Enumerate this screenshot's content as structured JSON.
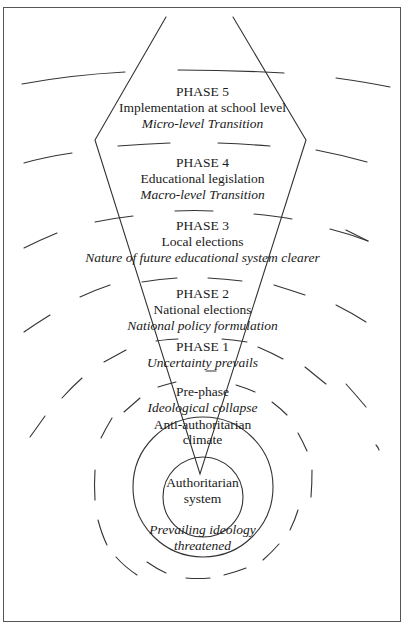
{
  "diagram": {
    "phases": [
      {
        "title": "PHASE 5",
        "line1": "Implementation at school level",
        "line2": "Micro-level Transition"
      },
      {
        "title": "PHASE 4",
        "line1": "Educational legislation",
        "line2": "Macro-level Transition"
      },
      {
        "title": "PHASE 3",
        "line1": "Local elections",
        "line2": "Nature of future educational system clearer"
      },
      {
        "title": "PHASE 2",
        "line1": "National elections",
        "line2": "National policy formulation"
      },
      {
        "title": "PHASE 1",
        "line2": "Uncertainty prevails"
      }
    ],
    "prephase": {
      "title": "Pre-phase",
      "subtitle": "Ideological collapse"
    },
    "climate": {
      "line1": "Anti-authoritarian",
      "line2": "climate"
    },
    "core": {
      "line1": "Authoritarian",
      "line2": "system"
    },
    "threat": {
      "line1": "Prevailing ideology",
      "line2": "threatened"
    },
    "colors": {
      "line": "#333333",
      "background": "#ffffff"
    }
  }
}
